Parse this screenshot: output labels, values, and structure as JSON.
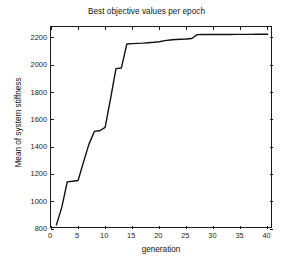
{
  "chart_data": {
    "type": "line",
    "title": "Best objective values per epoch",
    "xlabel": "generation",
    "ylabel": "Mean of system stiffness",
    "xlim": [
      0,
      41
    ],
    "ylim": [
      800,
      2280
    ],
    "grid": false,
    "legend": null,
    "xticks": [
      0,
      5,
      10,
      15,
      20,
      25,
      30,
      35,
      40
    ],
    "yticks": [
      800,
      1000,
      1200,
      1400,
      1600,
      1800,
      2000,
      2200
    ],
    "line_color": "#111111",
    "line_width": 1.4,
    "series": [
      {
        "name": "Mean of system stiffness",
        "x": [
          1,
          2,
          3,
          4,
          5,
          6,
          7,
          8,
          9,
          10,
          11,
          12,
          13,
          14,
          15,
          16,
          17,
          18,
          19,
          20,
          21,
          22,
          23,
          24,
          25,
          26,
          27,
          28,
          29,
          30,
          31,
          32,
          33,
          34,
          35,
          36,
          37,
          38,
          39,
          40
        ],
        "values": [
          830,
          960,
          1145,
          1150,
          1155,
          1290,
          1420,
          1515,
          1520,
          1545,
          1755,
          1975,
          1980,
          2155,
          2158,
          2160,
          2162,
          2165,
          2168,
          2172,
          2180,
          2185,
          2188,
          2190,
          2192,
          2196,
          2224,
          2225,
          2225,
          2225,
          2225,
          2225,
          2225,
          2226,
          2226,
          2226,
          2226,
          2227,
          2227,
          2227
        ]
      }
    ]
  },
  "axes": {
    "title": "Best objective values per epoch",
    "x_axis_label": "generation",
    "y_axis_label": "Mean of system stiffness",
    "x_tick_labels": [
      "0",
      "5",
      "10",
      "15",
      "20",
      "25",
      "30",
      "35",
      "40"
    ],
    "y_tick_labels": [
      "800",
      "1000",
      "1200",
      "1400",
      "1600",
      "1800",
      "2000",
      "2200"
    ]
  }
}
